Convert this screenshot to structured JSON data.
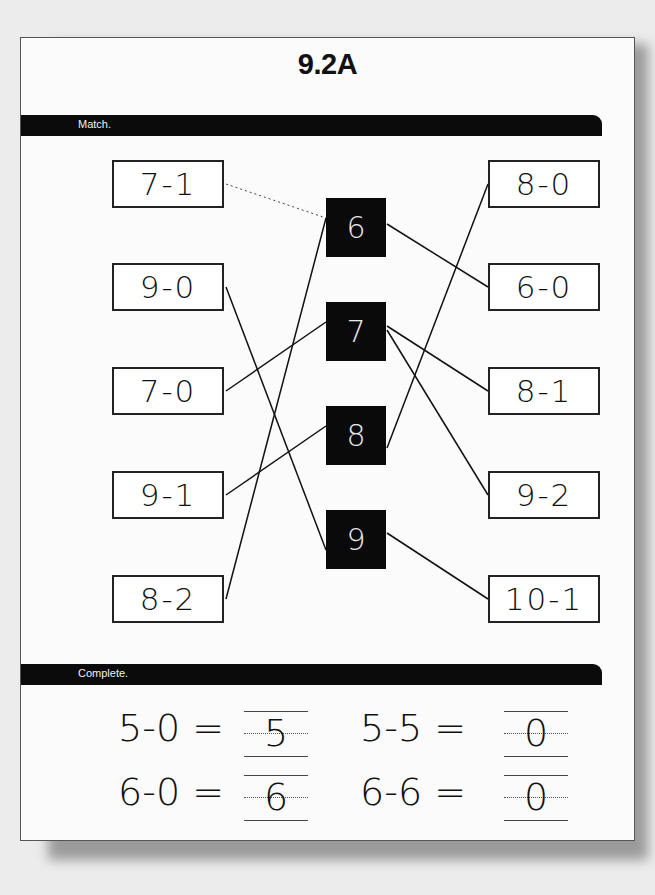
{
  "worksheet": {
    "title": "9.2A",
    "sections": {
      "match": {
        "label": "Match.",
        "left_expressions": [
          "7-1",
          "9-0",
          "7-0",
          "9-1",
          "8-2"
        ],
        "answers": [
          "6",
          "7",
          "8",
          "9"
        ],
        "right_expressions": [
          "8-0",
          "6-0",
          "8-1",
          "9-2",
          "10-1"
        ],
        "connections": [
          {
            "from": "7-1",
            "to": "6",
            "style": "dotted"
          },
          {
            "from": "8-2",
            "to": "6",
            "style": "solid"
          },
          {
            "from": "6",
            "to": "6-0",
            "style": "solid"
          },
          {
            "from": "7-0",
            "to": "7",
            "style": "solid"
          },
          {
            "from": "7",
            "to": "8-1",
            "style": "solid"
          },
          {
            "from": "7",
            "to": "9-2",
            "style": "solid"
          },
          {
            "from": "9-1",
            "to": "8",
            "style": "solid"
          },
          {
            "from": "8",
            "to": "8-0",
            "style": "solid"
          },
          {
            "from": "9-0",
            "to": "9",
            "style": "solid"
          },
          {
            "from": "9",
            "to": "10-1",
            "style": "solid"
          }
        ]
      },
      "complete": {
        "label": "Complete.",
        "problems": [
          {
            "equation": "5-0 =",
            "answer": "5"
          },
          {
            "equation": "5-5 =",
            "answer": "0"
          },
          {
            "equation": "6-0 =",
            "answer": "6"
          },
          {
            "equation": "6-6 =",
            "answer": "0"
          }
        ]
      }
    }
  }
}
